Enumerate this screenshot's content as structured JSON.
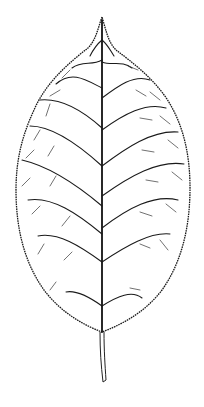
{
  "figure": {
    "style": "black and white botanical line drawing",
    "features": [
      "serrated margin",
      "pinnate venation",
      "acuminate tip",
      "petiole"
    ],
    "colors": {
      "background": "#ffffff",
      "ink": "#1a1a1a"
    }
  }
}
